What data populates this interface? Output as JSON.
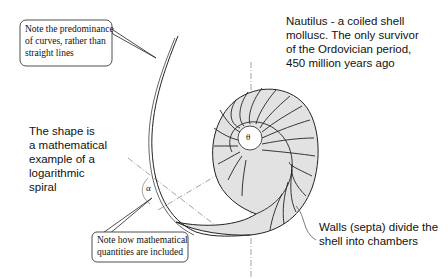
{
  "diagram": {
    "callouts": {
      "curves_note": [
        "Note the predominance",
        "of curves, rather than",
        "straight lines"
      ],
      "math_note": [
        "Note how mathematical",
        "quantities are included"
      ]
    },
    "labels": {
      "nautilus": [
        "Nautilus - a coiled shell",
        "mollusc. The only survivor",
        "of the Ordovician period,",
        "450 million years ago"
      ],
      "shape": [
        "The shape is",
        "a mathematical",
        "example of a",
        "logarithmic",
        "spiral"
      ],
      "walls": [
        "Walls (septa) divide the",
        "shell into chambers"
      ]
    },
    "symbols": {
      "alpha": "α",
      "theta": "θ"
    },
    "colors": {
      "shell_fill": "#e2e2e2",
      "line": "#222222",
      "construction_line": "#888888"
    }
  }
}
